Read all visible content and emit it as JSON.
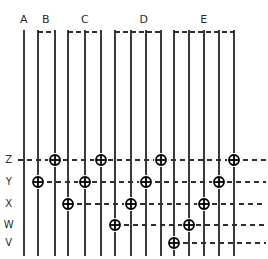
{
  "figure": {
    "width": 268,
    "height": 259,
    "background_color": "#ffffff",
    "line_color": "#3a3a3a",
    "dash_color": "#2e2e2e",
    "marker_color": "#000000",
    "label_color": "#2b2b2b"
  },
  "groups": [
    {
      "id": "A",
      "label": "A",
      "label_x": 24,
      "bracket_x1": 24,
      "bracket_x2": 24,
      "columns": 1
    },
    {
      "id": "B",
      "label": "B",
      "label_x": 46,
      "bracket_x1": 38,
      "bracket_x2": 55,
      "columns": 2
    },
    {
      "id": "C",
      "label": "C",
      "label_x": 85,
      "bracket_x1": 68,
      "bracket_x2": 101,
      "columns": 3
    },
    {
      "id": "D",
      "label": "D",
      "label_x": 144,
      "bracket_x1": 115,
      "bracket_x2": 161,
      "columns": 4
    },
    {
      "id": "E",
      "label": "E",
      "label_x": 204,
      "bracket_x1": 174,
      "bracket_x2": 234,
      "columns": 5
    }
  ],
  "columns": [
    {
      "index": 0,
      "group": "A",
      "x": 24
    },
    {
      "index": 1,
      "group": "B",
      "x": 38
    },
    {
      "index": 2,
      "group": "B",
      "x": 55
    },
    {
      "index": 3,
      "group": "C",
      "x": 68
    },
    {
      "index": 4,
      "group": "C",
      "x": 85
    },
    {
      "index": 5,
      "group": "C",
      "x": 101
    },
    {
      "index": 6,
      "group": "D",
      "x": 115
    },
    {
      "index": 7,
      "group": "D",
      "x": 131
    },
    {
      "index": 8,
      "group": "D",
      "x": 146
    },
    {
      "index": 9,
      "group": "D",
      "x": 161
    },
    {
      "index": 10,
      "group": "E",
      "x": 174
    },
    {
      "index": 11,
      "group": "E",
      "x": 189
    },
    {
      "index": 12,
      "group": "E",
      "x": 204
    },
    {
      "index": 13,
      "group": "E",
      "x": 219
    },
    {
      "index": 14,
      "group": "E",
      "x": 234
    }
  ],
  "rows": [
    {
      "id": "Z",
      "label": "Z",
      "y": 160,
      "label_x": 9,
      "dash_x1": 18,
      "dash_x2": 266
    },
    {
      "id": "Y",
      "label": "Y",
      "y": 182,
      "label_x": 9,
      "dash_x1": 38,
      "dash_x2": 266
    },
    {
      "id": "X",
      "label": "X",
      "y": 204,
      "label_x": 9,
      "dash_x1": 68,
      "dash_x2": 266
    },
    {
      "id": "W",
      "label": "W",
      "y": 225,
      "label_x": 9,
      "dash_x1": 115,
      "dash_x2": 266
    },
    {
      "id": "V",
      "label": "V",
      "y": 243,
      "label_x": 9,
      "dash_x1": 174,
      "dash_x2": 266
    }
  ],
  "markers": [
    {
      "id": "m-B2-Z",
      "column": 2,
      "row": "Z",
      "x": 55,
      "y": 160,
      "group": "B"
    },
    {
      "id": "m-C5-Z",
      "column": 5,
      "row": "Z",
      "x": 101,
      "y": 160,
      "group": "C"
    },
    {
      "id": "m-D9-Z",
      "column": 9,
      "row": "Z",
      "x": 161,
      "y": 160,
      "group": "D"
    },
    {
      "id": "m-E14-Z",
      "column": 14,
      "row": "Z",
      "x": 234,
      "y": 160,
      "group": "E"
    },
    {
      "id": "m-B1-Y",
      "column": 1,
      "row": "Y",
      "x": 38,
      "y": 182,
      "group": "B"
    },
    {
      "id": "m-C4-Y",
      "column": 4,
      "row": "Y",
      "x": 85,
      "y": 182,
      "group": "C"
    },
    {
      "id": "m-D8-Y",
      "column": 8,
      "row": "Y",
      "x": 146,
      "y": 182,
      "group": "D"
    },
    {
      "id": "m-E13-Y",
      "column": 13,
      "row": "Y",
      "x": 219,
      "y": 182,
      "group": "E"
    },
    {
      "id": "m-C3-X",
      "column": 3,
      "row": "X",
      "x": 68,
      "y": 204,
      "group": "C"
    },
    {
      "id": "m-D7-X",
      "column": 7,
      "row": "X",
      "x": 131,
      "y": 204,
      "group": "D"
    },
    {
      "id": "m-E12-X",
      "column": 12,
      "row": "X",
      "x": 204,
      "y": 204,
      "group": "E"
    },
    {
      "id": "m-D6-W",
      "column": 6,
      "row": "W",
      "x": 115,
      "y": 225,
      "group": "D"
    },
    {
      "id": "m-E11-W",
      "column": 11,
      "row": "W",
      "x": 189,
      "y": 225,
      "group": "E"
    },
    {
      "id": "m-E10-V",
      "column": 10,
      "row": "V",
      "x": 174,
      "y": 243,
      "group": "E"
    }
  ],
  "geometry": {
    "column_top": 30,
    "column_bottom": 256,
    "bracket_y": 32,
    "marker_radius": 7,
    "marker_inner_radius": 5,
    "marker_cross_arm": 5
  },
  "chart_data": {
    "type": "scatter",
    "xlabel": "",
    "ylabel": "",
    "x_categories": [
      "A",
      "B",
      "C",
      "D",
      "E"
    ],
    "y_categories": [
      "Z",
      "Y",
      "X",
      "W",
      "V"
    ],
    "series": [
      {
        "name": "Z",
        "values": [
          "B",
          "C",
          "D",
          "E"
        ]
      },
      {
        "name": "Y",
        "values": [
          "B",
          "C",
          "D",
          "E"
        ]
      },
      {
        "name": "X",
        "values": [
          "C",
          "D",
          "E"
        ]
      },
      {
        "name": "W",
        "values": [
          "D",
          "E"
        ]
      },
      {
        "name": "V",
        "values": [
          "E"
        ]
      }
    ],
    "points": [
      {
        "group": "A",
        "column": 0,
        "row": null
      },
      {
        "group": "B",
        "column": 1,
        "row": "Y"
      },
      {
        "group": "B",
        "column": 2,
        "row": "Z"
      },
      {
        "group": "C",
        "column": 3,
        "row": "X"
      },
      {
        "group": "C",
        "column": 4,
        "row": "Y"
      },
      {
        "group": "C",
        "column": 5,
        "row": "Z"
      },
      {
        "group": "D",
        "column": 6,
        "row": "W"
      },
      {
        "group": "D",
        "column": 7,
        "row": "X"
      },
      {
        "group": "D",
        "column": 8,
        "row": "Y"
      },
      {
        "group": "D",
        "column": 9,
        "row": "Z"
      },
      {
        "group": "E",
        "column": 10,
        "row": "V"
      },
      {
        "group": "E",
        "column": 11,
        "row": "W"
      },
      {
        "group": "E",
        "column": 12,
        "row": "X"
      },
      {
        "group": "E",
        "column": 13,
        "row": "Y"
      },
      {
        "group": "E",
        "column": 14,
        "row": "Z"
      }
    ],
    "grid": true,
    "legend": "none"
  }
}
